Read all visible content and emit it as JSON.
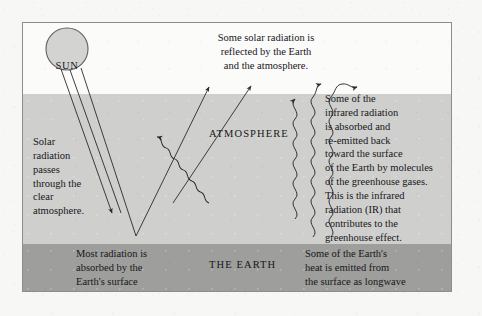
{
  "figure": {
    "bands": {
      "space": {
        "name": "space",
        "color": "#fbfbfa"
      },
      "atmosphere": {
        "name": "atmosphere",
        "label": "ATMOSPHERE",
        "color": "#cfcfcd"
      },
      "earth": {
        "name": "earth",
        "label": "THE EARTH",
        "color": "#9e9e9c"
      }
    },
    "sun": {
      "label": "SUN",
      "fill": "#d3d3d1",
      "stroke": "#5f5f5f"
    },
    "frame_color": "#8d8d8d",
    "line_color": "#2a2a2e",
    "annotations": {
      "reflected": "Some solar radiation is\nreflected by the Earth\nand the atmosphere.",
      "solar_passes": "Solar\nradiation\npasses\nthrough the\nclear\natmosphere.",
      "absorbed_reemitted": "Some of the\ninfrared radiation\nis absorbed and\nre-emitted back\ntoward the surface\nof the Earth by molecules\nof the greenhouse gases.\nThis is the infrared\nradiation (IR) that\ncontributes to the\ngreenhouse effect.",
      "most_absorbed": "Most radiation is\nabsorbed by the\nEarth's surface\nand warms it.",
      "earth_heat": "Some of the Earth's\nheat is emitted from\nthe surface as longwave\ninfrared radiation."
    }
  }
}
